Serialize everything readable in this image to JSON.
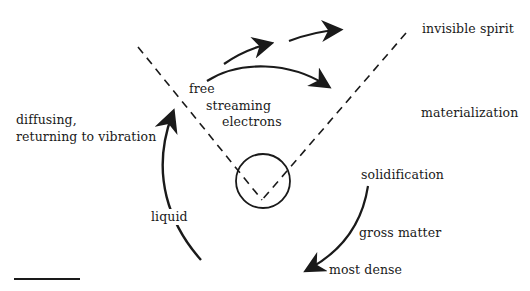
{
  "diagram": {
    "type": "cycle-diagram",
    "labels": {
      "free": "free",
      "streaming": "streaming",
      "electrons": "electrons",
      "invisible_spirit": "invisible spirit",
      "materialization": "materialization",
      "solidification": "solidification",
      "gross_matter": "gross matter",
      "most_dense": "most dense",
      "liquid": "liquid",
      "diffusing_line1": "diffusing,",
      "diffusing_line2": "returning to vibration"
    },
    "colors": {
      "ink": "#1a1a1a",
      "background": "#ffffff"
    },
    "elements": {
      "center_circle": "circle",
      "dashed_lines": 2,
      "arrows": [
        "up-left-arc",
        "upper-short-arrow-1",
        "upper-short-arrow-2",
        "upper-long-arrow",
        "down-right-arc"
      ]
    }
  }
}
